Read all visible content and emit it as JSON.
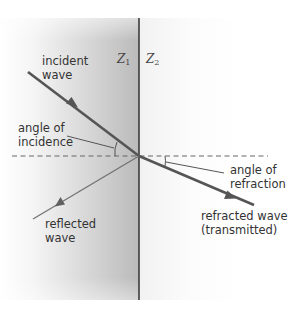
{
  "diagram": {
    "media": [
      {
        "id": "Z1",
        "label": "Z",
        "subscript": "1",
        "side": "left",
        "shade": "#bcbcbc"
      },
      {
        "id": "Z2",
        "label": "Z",
        "subscript": "2",
        "side": "right",
        "shade": "#f2f2f2"
      }
    ],
    "labels": {
      "incident_line1": "incident",
      "incident_line2": "wave",
      "angle_incidence_line1": "angle of",
      "angle_incidence_line2": "incidence",
      "angle_refraction_line1": "angle of",
      "angle_refraction_line2": "refraction",
      "reflected_line1": "reflected",
      "reflected_line2": "wave",
      "refracted_line1": "refracted wave",
      "refracted_line2": "(transmitted)"
    },
    "geometry": {
      "boundary_x": 139,
      "incidence_point": [
        139,
        156
      ],
      "normal_dashed_extent": [
        12,
        268
      ],
      "incident_ray": {
        "from": [
          28,
          72
        ],
        "to": [
          139,
          156
        ]
      },
      "reflected_ray": {
        "from": [
          139,
          156
        ],
        "to": [
          33,
          219
        ]
      },
      "refracted_ray": {
        "from": [
          139,
          156
        ],
        "to": [
          254,
          205
        ]
      }
    },
    "colors": {
      "ray": "#555555",
      "boundary": "#3a3a3a",
      "text": "#333333"
    }
  }
}
